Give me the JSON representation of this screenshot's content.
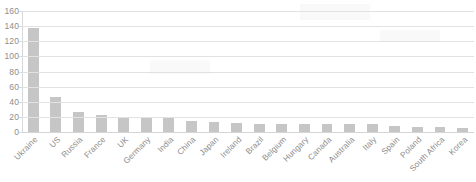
{
  "chart_data": {
    "type": "bar",
    "title": "",
    "subtitle": "",
    "xlabel": "",
    "ylabel": "",
    "ylim": [
      0,
      160
    ],
    "ytick_step": 20,
    "yticks": [
      "160",
      "140",
      "120",
      "100",
      "80",
      "60",
      "40",
      "20",
      "0"
    ],
    "grid": true,
    "legend": false,
    "legend_position": "none",
    "orientation": "vertical",
    "bar_color": "#c6c6c6",
    "gridline_color": "#e2e2e2",
    "axis_color": "#d8d8d8",
    "label_color": "#8b8b8b",
    "categories": [
      "Ukraine",
      "US",
      "Russia",
      "France",
      "UK",
      "Germany",
      "India",
      "China",
      "Japan",
      "Ireland",
      "Brazil",
      "Belgium",
      "Hungary",
      "Canada",
      "Australia",
      "Italy",
      "Spain",
      "Poland",
      "South Africa",
      "Korea"
    ],
    "values": [
      138,
      46,
      26,
      22,
      19,
      18,
      18,
      15,
      13,
      12,
      11,
      11,
      11,
      11,
      10,
      10,
      8,
      7,
      7,
      5
    ]
  }
}
